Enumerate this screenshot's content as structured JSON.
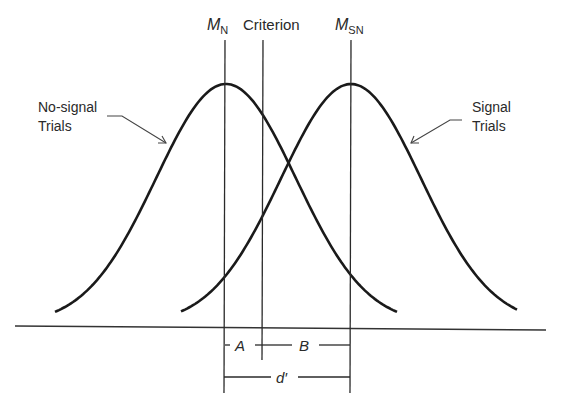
{
  "diagram": {
    "labels": {
      "mean_noise": {
        "main": "M",
        "sub": "N"
      },
      "criterion": "Criterion",
      "mean_signal_noise": {
        "main": "M",
        "sub": "SN"
      },
      "noise_line1": "No-signal",
      "noise_line2": "Trials",
      "signal_line1": "Signal",
      "signal_line2": "Trials",
      "segment_a": "A",
      "segment_b": "B",
      "d_prime": "d′"
    },
    "distributions": [
      {
        "name": "No-signal Trials",
        "center_x": 226,
        "sigma": 70,
        "peak_y": 84,
        "base_y": 324,
        "x_start": 55,
        "x_end": 397
      },
      {
        "name": "Signal Trials",
        "center_x": 351,
        "sigma": 70,
        "peak_y": 84,
        "base_y": 324,
        "x_start": 181,
        "x_end": 518
      }
    ],
    "lines": {
      "mean_noise_x": 225,
      "criterion_x": 262,
      "mean_signal_noise_x": 350
    },
    "colors": {
      "ink": "#1a1a1a",
      "background": "#ffffff"
    }
  }
}
